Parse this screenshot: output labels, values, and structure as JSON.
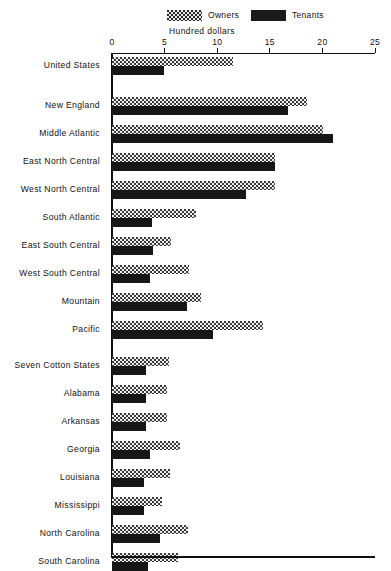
{
  "legend": {
    "owners": {
      "label": "Owners",
      "icon": "checker-swatch-icon",
      "color": "#3a3a3a"
    },
    "tenants": {
      "label": "Tenants",
      "icon": "solid-swatch-icon",
      "color": "#171717"
    }
  },
  "axis": {
    "title": "Hundred  dollars",
    "ticks": [
      "0",
      "5",
      "10",
      "15",
      "20",
      "25"
    ]
  },
  "chart_data": {
    "type": "bar",
    "orientation": "horizontal",
    "title": "Hundred  dollars",
    "xlabel": "Hundred  dollars",
    "ylabel": "",
    "xlim": [
      0,
      25
    ],
    "xticks": [
      0,
      5,
      10,
      15,
      20,
      25
    ],
    "grid": false,
    "legend_position": "top-center",
    "categories": [
      "United States",
      "New England",
      "Middle Atlantic",
      "East North Central",
      "West North Central",
      "South Atlantic",
      "East South Central",
      "West South Central",
      "Mountain",
      "Pacific",
      "Seven Cotton States",
      "Alabama",
      "Arkansas",
      "Georgia",
      "Louisiana",
      "Mississippi",
      "North Carolina",
      "South Carolina"
    ],
    "series": [
      {
        "name": "Owners",
        "values": [
          11.5,
          18.5,
          20.1,
          15.5,
          15.5,
          8.0,
          5.6,
          7.3,
          8.5,
          14.4,
          5.4,
          5.2,
          5.2,
          6.5,
          5.5,
          4.8,
          7.2,
          6.3
        ]
      },
      {
        "name": "Tenants",
        "values": [
          4.9,
          16.7,
          21.0,
          15.5,
          12.7,
          3.8,
          3.9,
          3.6,
          7.1,
          9.6,
          3.2,
          3.2,
          3.2,
          3.6,
          3.0,
          3.0,
          4.6,
          3.4
        ]
      }
    ]
  },
  "rows": [
    {
      "label": "United States",
      "indent": false,
      "owners": 11.5,
      "tenants": 4.9,
      "top": 3,
      "gap_after": true
    },
    {
      "label": "New England",
      "indent": false,
      "owners": 18.5,
      "tenants": 16.7,
      "top": 43,
      "gap_after": false
    },
    {
      "label": "Middle Atlantic",
      "indent": false,
      "owners": 20.1,
      "tenants": 21.0,
      "top": 71,
      "gap_after": false
    },
    {
      "label": "East North Central",
      "indent": false,
      "owners": 15.5,
      "tenants": 15.5,
      "top": 99,
      "gap_after": false
    },
    {
      "label": "West North Central",
      "indent": false,
      "owners": 15.5,
      "tenants": 12.7,
      "top": 127,
      "gap_after": false
    },
    {
      "label": "South Atlantic",
      "indent": false,
      "owners": 8.0,
      "tenants": 3.8,
      "top": 155,
      "gap_after": false
    },
    {
      "label": "East South Central",
      "indent": false,
      "owners": 5.6,
      "tenants": 3.9,
      "top": 183,
      "gap_after": false
    },
    {
      "label": "West South Central",
      "indent": false,
      "owners": 7.3,
      "tenants": 3.6,
      "top": 211,
      "gap_after": false
    },
    {
      "label": "Mountain",
      "indent": false,
      "owners": 8.5,
      "tenants": 7.1,
      "top": 239,
      "gap_after": false
    },
    {
      "label": "Pacific",
      "indent": false,
      "owners": 14.4,
      "tenants": 9.6,
      "top": 267,
      "gap_after": true
    },
    {
      "label": "Seven Cotton States",
      "indent": false,
      "owners": 5.4,
      "tenants": 3.2,
      "top": 303,
      "gap_after": false
    },
    {
      "label": "Alabama",
      "indent": true,
      "owners": 5.2,
      "tenants": 3.2,
      "top": 331,
      "gap_after": false
    },
    {
      "label": "Arkansas",
      "indent": true,
      "owners": 5.2,
      "tenants": 3.2,
      "top": 359,
      "gap_after": false
    },
    {
      "label": "Georgia",
      "indent": true,
      "owners": 6.5,
      "tenants": 3.6,
      "top": 387,
      "gap_after": false
    },
    {
      "label": "Louisiana",
      "indent": true,
      "owners": 5.5,
      "tenants": 3.0,
      "top": 415,
      "gap_after": false
    },
    {
      "label": "Mississippi",
      "indent": true,
      "owners": 4.8,
      "tenants": 3.0,
      "top": 443,
      "gap_after": false
    },
    {
      "label": "North Carolina",
      "indent": true,
      "owners": 7.2,
      "tenants": 4.6,
      "top": 471,
      "gap_after": false
    },
    {
      "label": "South Carolina",
      "indent": true,
      "owners": 6.3,
      "tenants": 3.4,
      "top": 499,
      "gap_after": false
    }
  ]
}
